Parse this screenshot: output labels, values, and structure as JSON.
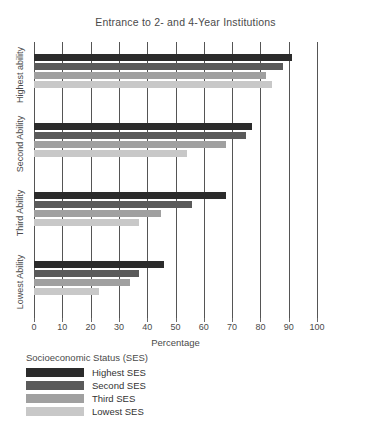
{
  "chart_data": {
    "type": "bar",
    "orientation": "horizontal",
    "title": "Entrance to 2- and 4-Year Institutions",
    "xlabel": "Percentage",
    "ylabel": "",
    "xlim": [
      0,
      100
    ],
    "xticks": [
      0,
      10,
      20,
      30,
      40,
      50,
      60,
      70,
      80,
      90,
      100
    ],
    "grid": "vertical",
    "categories": [
      "Highest ability",
      "Second Ability",
      "Third Ability",
      "Lowest Ability"
    ],
    "legend_title": "Socioeconomic Status (SES)",
    "legend_position": "below",
    "series": [
      {
        "name": "Highest SES",
        "color": "#2b2b2b",
        "values": [
          91,
          77,
          68,
          46
        ]
      },
      {
        "name": "Second SES",
        "color": "#5a5a5a",
        "values": [
          88,
          75,
          56,
          37
        ]
      },
      {
        "name": "Third SES",
        "color": "#a0a0a0",
        "values": [
          82,
          68,
          45,
          34
        ]
      },
      {
        "name": "Lowest SES",
        "color": "#c8c8c8",
        "values": [
          84,
          54,
          37,
          23
        ]
      }
    ]
  },
  "axis": {
    "tick_labels": [
      "0",
      "10",
      "20",
      "30",
      "40",
      "50",
      "60",
      "70",
      "80",
      "90",
      "100"
    ],
    "x_title": "Percentage"
  },
  "legend": {
    "title": "Socioeconomic Status (SES)",
    "items": [
      {
        "label": "Highest SES",
        "color": "#2b2b2b"
      },
      {
        "label": "Second SES",
        "color": "#5a5a5a"
      },
      {
        "label": "Third SES",
        "color": "#a0a0a0"
      },
      {
        "label": "Lowest SES",
        "color": "#c8c8c8"
      }
    ]
  },
  "title": "Entrance to 2- and 4-Year Institutions"
}
